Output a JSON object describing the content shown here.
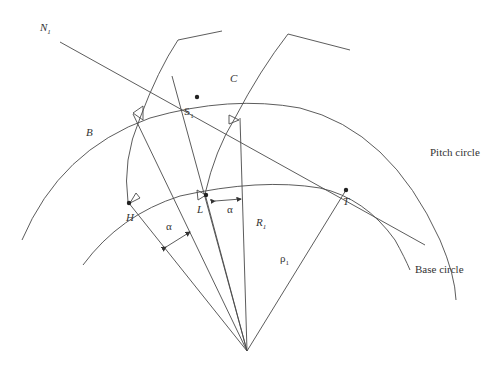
{
  "colors": {
    "stroke": "#4a4a4a",
    "text": "#333333",
    "background": "#ffffff"
  },
  "labels": {
    "N1": "N",
    "N1_sub": "1",
    "C": "C",
    "S1": "S",
    "S1_sub": "1",
    "B": "B",
    "L": "L",
    "H": "H",
    "T": "T",
    "R1": "R",
    "R1_sub": "1",
    "rho1": "ρ",
    "rho1_sub": "1",
    "alpha_1": "α",
    "alpha_2": "α",
    "pitch_circle": "Pitch circle",
    "base_circle": "Base circle"
  },
  "points": [
    "N1",
    "C",
    "S1",
    "B",
    "L",
    "H",
    "T"
  ],
  "angles": [
    "alpha",
    "alpha"
  ]
}
